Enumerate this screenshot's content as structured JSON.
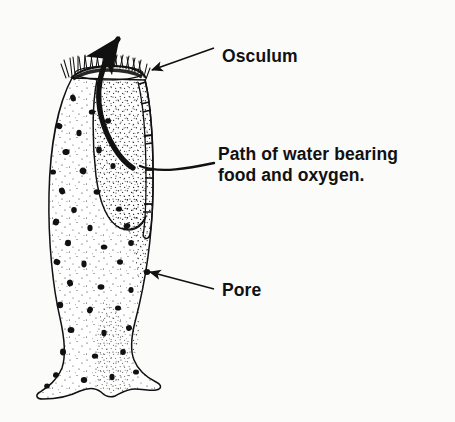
{
  "figure": {
    "background_color": "#fbfbfa",
    "ink_color": "#111111",
    "width": 455,
    "height": 422
  },
  "labels": {
    "osculum": "Osculum",
    "path_line1": "Path of water bearing",
    "path_line2": "food and oxygen.",
    "pore": "Pore"
  },
  "callouts": [
    {
      "id": "osculum",
      "text": "Osculum",
      "text_x": 222,
      "text_y": 62,
      "leader": {
        "type": "straight-arrow",
        "x1": 214,
        "y1": 48,
        "x2": 152,
        "y2": 70
      }
    },
    {
      "id": "path-of-water",
      "text_line1": "Path of water bearing",
      "text_line2": "food and oxygen.",
      "text_x": 218,
      "text_y": 160,
      "leader": {
        "type": "curved-line",
        "x1": 214,
        "y1": 163,
        "x2": 140,
        "y2": 166
      }
    },
    {
      "id": "pore",
      "text": "Pore",
      "text_x": 222,
      "text_y": 296,
      "leader": {
        "type": "straight-arrow",
        "x1": 214,
        "y1": 289,
        "x2": 148,
        "y2": 273
      }
    }
  ],
  "anatomy": {
    "osculum_label": "osculum opening at top rim",
    "spicules_label": "spicule fringe",
    "water_path_label": "thick curved arrow of water flow exiting osculum",
    "pore_label": "ostia pores speckled over body wall",
    "base_label": "flared wavy holdfast base"
  }
}
